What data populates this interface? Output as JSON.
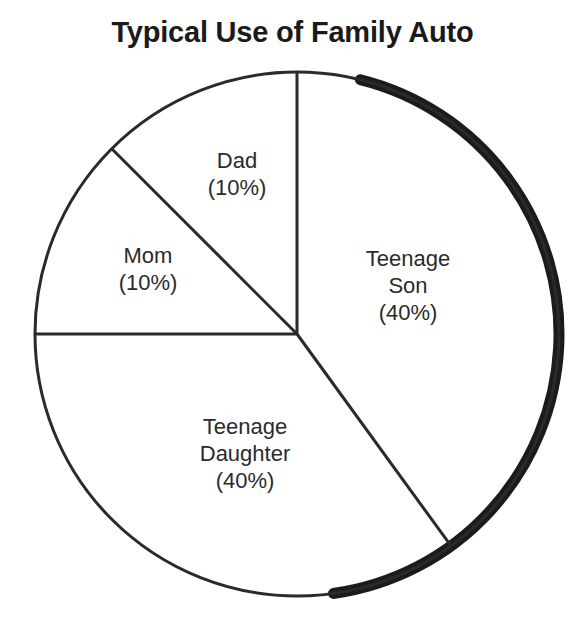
{
  "chart_data": {
    "type": "pie",
    "title": "Typical Use of Family Auto",
    "xlabel": "",
    "ylabel": "",
    "legend": "none",
    "grid": false,
    "categories": [
      "Teenage Son",
      "Teenage Daughter",
      "Mom",
      "Dad"
    ],
    "values": [
      40,
      40,
      10,
      10
    ],
    "value_unit": "%",
    "slices": [
      {
        "name": "Teenage Son",
        "label_lines": [
          "Teenage",
          "Son",
          "(40%)"
        ],
        "value": 40,
        "percent_text": "(40%)",
        "start_angle_deg": 0,
        "end_angle_deg": 144,
        "label_x": 408,
        "label_y": 285
      },
      {
        "name": "Teenage Daughter",
        "label_lines": [
          "Teenage",
          "Daughter",
          "(40%)"
        ],
        "value": 40,
        "percent_text": "(40%)",
        "start_angle_deg": 144,
        "end_angle_deg": 270,
        "label_x": 245,
        "label_y": 453
      },
      {
        "name": "Mom",
        "label_lines": [
          "Mom",
          "(10%)"
        ],
        "value": 10,
        "percent_text": "(10%)",
        "start_angle_deg": 270,
        "end_angle_deg": 315,
        "label_x": 148,
        "label_y": 269
      },
      {
        "name": "Dad",
        "label_lines": [
          "Dad",
          "(10%)"
        ],
        "value": 10,
        "percent_text": "(10%)",
        "start_angle_deg": 315,
        "end_angle_deg": 360,
        "label_x": 237,
        "label_y": 174
      }
    ],
    "geometry": {
      "center_x": 297,
      "center_y": 334,
      "radius": 262,
      "shadow_start_deg": 14,
      "shadow_end_deg": 172
    },
    "colors": {
      "background": "#ffffff",
      "stroke": "#2a2a2a",
      "title": "#1a1a1a",
      "label": "#2b2b2b",
      "shadow": "#1b1b1b"
    }
  }
}
